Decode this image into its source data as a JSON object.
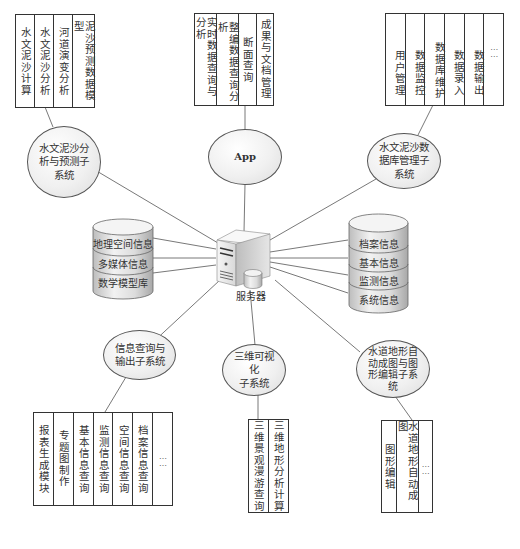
{
  "diagram": {
    "center": {
      "label": "服务器",
      "icon": "server-icon"
    },
    "subsystems": [
      {
        "id": "sediment-analysis",
        "label": "水文泥沙分析与预测子系统",
        "label_lines": [
          "水文泥沙分",
          "析与预测子",
          "系统"
        ],
        "modules": [
          "水文泥沙计算",
          "水文泥沙分析",
          "河道演变分析",
          "泥沙预测数据模型"
        ]
      },
      {
        "id": "app",
        "label": "App",
        "label_lines": [
          "App"
        ],
        "modules": [
          "实时数据查询与分析",
          "整编数据查询分析",
          "断面查询",
          "成果与文档管理"
        ]
      },
      {
        "id": "db-management",
        "label": "水文泥沙数据库管理子系统",
        "label_lines": [
          "水文泥沙数",
          "据库管理子",
          "系统"
        ],
        "modules": [
          "用户管理",
          "数据监控",
          "数据库维护",
          "数据录入",
          "数据输出",
          "……"
        ]
      },
      {
        "id": "info-query",
        "label": "信息查询与输出子系统",
        "label_lines": [
          "信息查询与",
          "输出子系统"
        ],
        "modules": [
          "报表生成模块",
          "专题图制作",
          "基本信息查询",
          "监测信息查询",
          "空间信息查询",
          "档案信息查询",
          "……"
        ]
      },
      {
        "id": "3d-visualization",
        "label": "三维可视化子系统",
        "label_lines": [
          "三维可视化",
          "子系统"
        ],
        "modules": [
          "三维景观漫游查询",
          "三维地形分析计算"
        ]
      },
      {
        "id": "terrain-mapping",
        "label": "水道地形自动成图与图形编辑子系统",
        "label_lines": [
          "水道地形自",
          "动成图与图",
          "形编辑子系",
          "统"
        ],
        "modules": [
          "图形编辑",
          "水道地形自动成图",
          "……"
        ]
      }
    ],
    "databases": [
      {
        "id": "left-db",
        "layers": [
          "地理空间信息",
          "多媒体信息",
          "数学模型库"
        ]
      },
      {
        "id": "right-db",
        "layers": [
          "档案信息",
          "基本信息",
          "监测信息",
          "系统信息"
        ]
      }
    ]
  }
}
